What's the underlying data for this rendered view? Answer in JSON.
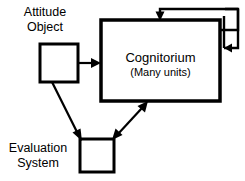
{
  "diagram": {
    "background_color": "#ffffff",
    "stroke_color": "#000000",
    "nodes": {
      "attitude_object": {
        "label_line1": "Attitude",
        "label_line2": "Object",
        "shape": "square"
      },
      "cognitorium": {
        "label_main": "Cognitorium",
        "label_sub": "(Many units)",
        "shape": "rectangle"
      },
      "evaluation_system": {
        "label_line1": "Evaluation",
        "label_line2": "System",
        "shape": "square"
      }
    },
    "edges": [
      {
        "name": "attitude-to-cognitorium",
        "from": "attitude_object",
        "to": "cognitorium",
        "arrow": "single"
      },
      {
        "name": "attitude-to-evaluation",
        "from": "attitude_object",
        "to": "evaluation_system",
        "arrow": "single"
      },
      {
        "name": "cognitorium-evaluation-bidirectional",
        "from": "cognitorium",
        "to": "evaluation_system",
        "arrow": "double"
      },
      {
        "name": "cognitorium-self-loop-top",
        "from": "cognitorium",
        "to": "cognitorium",
        "arrow": "single"
      },
      {
        "name": "cognitorium-self-loop-right",
        "from": "cognitorium",
        "to": "cognitorium",
        "arrow": "single"
      }
    ]
  }
}
